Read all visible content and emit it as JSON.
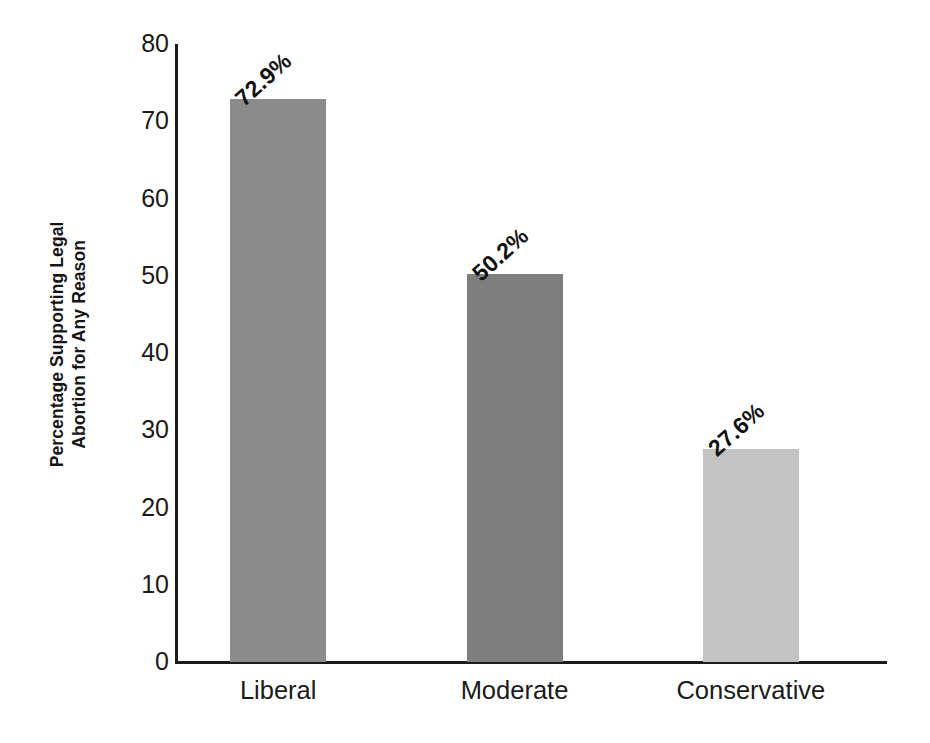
{
  "chart_data": {
    "type": "bar",
    "title": "",
    "subtitle": "",
    "xlabel": "",
    "ylabel": "Percentage Supporting Legal Abortion for Any Reason",
    "ylabel_lines": [
      "Percentage Supporting Legal",
      "Abortion for Any Reason"
    ],
    "categories": [
      "Liberal",
      "Moderate",
      "Conservative"
    ],
    "values": [
      72.9,
      50.2,
      27.6
    ],
    "data_labels": [
      "72.9%",
      "50.2%",
      "27.6%"
    ],
    "bar_colors": [
      "#8c8c8c",
      "#7e7e7e",
      "#c3c3c3"
    ],
    "ylim": [
      0,
      80
    ],
    "yticks": [
      0,
      10,
      20,
      30,
      40,
      50,
      60,
      70,
      80
    ],
    "ytick_labels": [
      "0",
      "10",
      "20",
      "30",
      "40",
      "50",
      "60",
      "70",
      "80"
    ],
    "grid": false,
    "legend": false,
    "legend_position": "none",
    "data_label_rotation_deg": 42,
    "axis_color": "#1c1c1c",
    "background_color": "#ffffff",
    "text_color": "#1a1a1a"
  }
}
